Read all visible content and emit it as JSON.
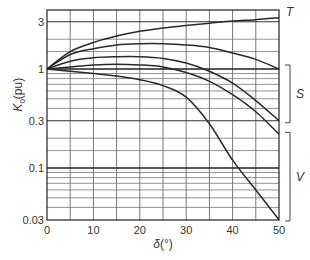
{
  "chart_data": {
    "type": "line",
    "title": "",
    "xlabel": "δ(°)",
    "ylabel": "K0(pu)",
    "ylabel_main": "K",
    "ylabel_sub": "0",
    "ylabel_unit": "(pu)",
    "xlabel_symbol": "δ",
    "xlabel_unit": "(°)",
    "xscale": "linear",
    "yscale": "log",
    "xlim": [
      0,
      50
    ],
    "ylim": [
      0.03,
      4
    ],
    "grid": true,
    "x_ticks": [
      0,
      10,
      20,
      30,
      40,
      50
    ],
    "x_tick_labels": [
      "0",
      "10",
      "20",
      "30",
      "40",
      "50"
    ],
    "x_minor_grid": [
      5,
      15,
      25,
      35,
      45
    ],
    "y_ticks": [
      0.03,
      0.1,
      0.3,
      1,
      3
    ],
    "y_tick_labels": [
      "0.03",
      "0.1",
      "0.3",
      "1",
      "3"
    ],
    "y_major_grid": [
      0.1,
      1
    ],
    "y_minor_grid": [
      0.04,
      0.05,
      0.06,
      0.07,
      0.08,
      0.09,
      0.15,
      0.2,
      0.3,
      0.4,
      0.5,
      0.6,
      0.7,
      0.8,
      0.9,
      1.5,
      2,
      3
    ],
    "series": [
      {
        "name": "T",
        "x": [
          0,
          5,
          10,
          15,
          20,
          25,
          30,
          35,
          40,
          45,
          50
        ],
        "values": [
          1.0,
          1.5,
          1.85,
          2.15,
          2.4,
          2.6,
          2.75,
          2.9,
          3.05,
          3.15,
          3.3
        ]
      },
      {
        "name": "S1",
        "x": [
          0,
          5,
          10,
          15,
          20,
          25,
          30,
          35,
          40,
          45,
          50
        ],
        "values": [
          1.0,
          1.4,
          1.6,
          1.75,
          1.8,
          1.8,
          1.75,
          1.65,
          1.45,
          1.25,
          1.0
        ]
      },
      {
        "name": "S2",
        "x": [
          0,
          5,
          10,
          15,
          20,
          25,
          30,
          35,
          40,
          45,
          50
        ],
        "values": [
          1.0,
          1.2,
          1.3,
          1.33,
          1.33,
          1.28,
          1.15,
          0.95,
          0.72,
          0.48,
          0.3
        ]
      },
      {
        "name": "S3",
        "x": [
          0,
          5,
          10,
          15,
          20,
          25,
          30,
          35,
          40,
          45,
          50
        ],
        "values": [
          1.0,
          1.05,
          1.1,
          1.12,
          1.1,
          1.05,
          0.92,
          0.75,
          0.55,
          0.37,
          0.22
        ]
      },
      {
        "name": "V",
        "x": [
          0,
          5,
          10,
          15,
          20,
          25,
          30,
          35,
          40,
          45,
          50
        ],
        "values": [
          1.0,
          0.95,
          0.9,
          0.85,
          0.78,
          0.68,
          0.52,
          0.28,
          0.12,
          0.06,
          0.03
        ]
      }
    ],
    "annotations": [
      {
        "text": "T",
        "target": "T",
        "position": "right of curve end at y≈3.3"
      },
      {
        "text": "S",
        "type": "bracket",
        "range": [
          0.3,
          1.0
        ]
      },
      {
        "text": "V",
        "type": "bracket",
        "range": [
          0.03,
          0.22
        ]
      }
    ],
    "legend": "none (curves labelled on right with T, S bracket, V bracket)"
  },
  "labels": {
    "T": "T",
    "S": "S",
    "V": "V"
  },
  "colors": {
    "line": "#2a2a2a",
    "grid": "#555555",
    "background": "#ffffff"
  }
}
